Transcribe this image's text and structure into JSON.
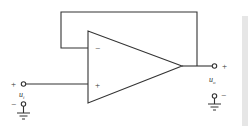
{
  "diagram": {
    "type": "op-amp voltage follower (unity-gain buffer)",
    "opamp": {
      "inverting_label": "−",
      "noninverting_label": "+"
    },
    "input": {
      "plus_label": "+",
      "minus_label": "−",
      "name": "u",
      "subscript": "i"
    },
    "output": {
      "plus_label": "+",
      "minus_label": "−",
      "name": "u",
      "subscript": "o"
    },
    "colors": {
      "line": "#333333",
      "side_bar": "#e6e6e6"
    }
  }
}
